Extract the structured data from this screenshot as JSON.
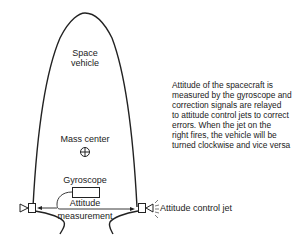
{
  "vehicle": {
    "label_line1": "Space",
    "label_line2": "vehicle"
  },
  "mass_center": {
    "label": "Mass center",
    "icon": "crosshair-circle-icon"
  },
  "gyroscope": {
    "label": "Gyroscope"
  },
  "attitude_measurement": {
    "line1": "Attitude",
    "line2": "measurement"
  },
  "control_jet": {
    "label": "Attitude control jet"
  },
  "description": {
    "lines": [
      "Attitude of the spacecraft is",
      "measured by the gyroscope and",
      "correction signals are relayed",
      "to attitude control jets to correct",
      "errors. When the jet on the",
      "right fires, the vehicle will be",
      "turned clockwise and vice versa"
    ]
  },
  "colors": {
    "line": "#222222",
    "background": "#ffffff"
  }
}
